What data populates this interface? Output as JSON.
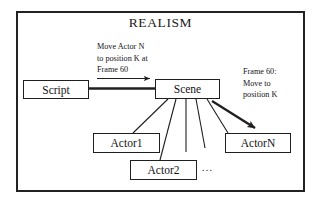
{
  "diagram": {
    "title": "REALISM",
    "frame_border_color": "#222222",
    "background_color": "#ffffff",
    "ink_color": "#1a1a1a"
  },
  "nodes": [
    {
      "id": "script",
      "label": "Script"
    },
    {
      "id": "scene",
      "label": "Scene"
    },
    {
      "id": "actor1",
      "label": "Actor1"
    },
    {
      "id": "actor2",
      "label": "Actor2"
    },
    {
      "id": "actorn",
      "label": "ActorN"
    }
  ],
  "annotations": [
    {
      "id": "script-to-scene-message",
      "text": "Move Actor N\nto position K at\nFrame 60"
    },
    {
      "id": "scene-to-actorn-message",
      "text": "Frame 60:\nMove to\nposition K"
    },
    {
      "id": "actors-ellipsis",
      "text": "..."
    }
  ]
}
